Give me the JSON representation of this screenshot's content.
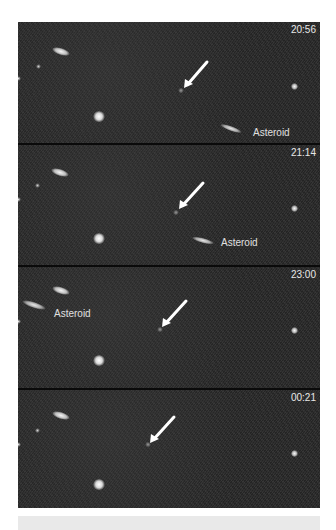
{
  "caption_fragment": "",
  "figure": {
    "panels": [
      {
        "time": "20:56",
        "asteroid_label": "Asteroid",
        "has_asteroid_label": true
      },
      {
        "time": "21:14",
        "asteroid_label": "Asteroid",
        "has_asteroid_label": true
      },
      {
        "time": "23:00",
        "asteroid_label": "Asteroid",
        "has_asteroid_label": true
      },
      {
        "time": "00:21",
        "asteroid_label": "",
        "has_asteroid_label": false
      }
    ],
    "arrow_target": "fixed faint object indicated by white arrow",
    "colors": {
      "background": "#303030",
      "separator": "#0a0a0a",
      "label_text": "#e8e8e8",
      "bottom_bar": "#e9e9e9"
    }
  }
}
